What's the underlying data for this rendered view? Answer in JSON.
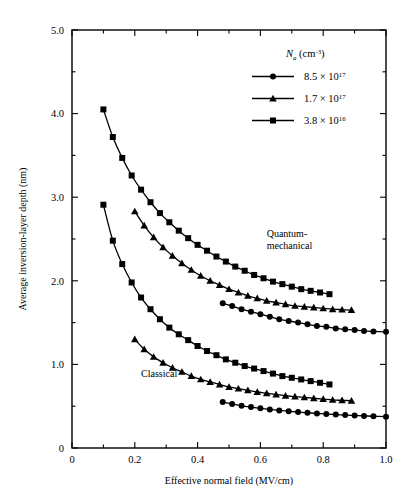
{
  "chart_data": {
    "type": "line",
    "title": "",
    "xlabel": "Effective normal field (MV/cm)",
    "ylabel": "Average inversion-layer depth (nm)",
    "xlim": [
      0,
      1.0
    ],
    "ylim": [
      0,
      5.0
    ],
    "xticks": [
      0,
      0.2,
      0.4,
      0.6,
      0.8,
      1.0
    ],
    "xticklabels": [
      "0",
      "0.2",
      "0.4",
      "0.6",
      "0.8",
      "1.0"
    ],
    "yticks": [
      0,
      1.0,
      2.0,
      3.0,
      4.0,
      5.0
    ],
    "yticklabels": [
      "0",
      "1.0",
      "2.0",
      "3.0",
      "4.0",
      "5.0"
    ],
    "xminor_step": 0.1,
    "yminor_step": 0.5,
    "grid": false,
    "legend_position": "top-right",
    "legend_title_parts": {
      "symbol": "N",
      "subscript": "a",
      "units": "(cm",
      "units_exp": "-3",
      "units_close": ")"
    },
    "annotations": [
      {
        "name": "quantum-mechanical-label",
        "text_line1": "Quantum-",
        "text_line2": "mechanical",
        "x": 0.62,
        "y": 2.52
      },
      {
        "name": "classical-label",
        "text": "Classical",
        "x": 0.22,
        "y": 0.85
      }
    ],
    "legend": [
      {
        "label_mantissa": "8.5 × 10",
        "label_exp": "17",
        "marker": "circle"
      },
      {
        "label_mantissa": "1.7 × 10",
        "label_exp": "17",
        "marker": "triangle"
      },
      {
        "label_mantissa": "3.8 × 10",
        "label_exp": "16",
        "marker": "square"
      }
    ],
    "series": [
      {
        "name": "quantum-mechanical-3.8e16",
        "group": "Quantum-mechanical",
        "marker": "square",
        "x": [
          0.1,
          0.13,
          0.16,
          0.19,
          0.22,
          0.25,
          0.28,
          0.31,
          0.34,
          0.37,
          0.4,
          0.43,
          0.46,
          0.49,
          0.52,
          0.55,
          0.58,
          0.61,
          0.64,
          0.67,
          0.7,
          0.73,
          0.76,
          0.79,
          0.82
        ],
        "y": [
          4.05,
          3.72,
          3.47,
          3.26,
          3.09,
          2.94,
          2.81,
          2.7,
          2.6,
          2.51,
          2.43,
          2.36,
          2.29,
          2.23,
          2.17,
          2.12,
          2.07,
          2.03,
          1.99,
          1.96,
          1.93,
          1.9,
          1.88,
          1.86,
          1.84
        ]
      },
      {
        "name": "quantum-mechanical-1.7e17",
        "group": "Quantum-mechanical",
        "marker": "triangle",
        "x": [
          0.2,
          0.23,
          0.26,
          0.29,
          0.32,
          0.35,
          0.38,
          0.41,
          0.44,
          0.47,
          0.5,
          0.53,
          0.56,
          0.59,
          0.62,
          0.65,
          0.68,
          0.71,
          0.74,
          0.77,
          0.8,
          0.83,
          0.86,
          0.89
        ],
        "y": [
          2.83,
          2.66,
          2.52,
          2.4,
          2.3,
          2.21,
          2.13,
          2.06,
          2.0,
          1.95,
          1.9,
          1.86,
          1.82,
          1.79,
          1.76,
          1.74,
          1.72,
          1.7,
          1.69,
          1.68,
          1.67,
          1.66,
          1.655,
          1.65
        ]
      },
      {
        "name": "quantum-mechanical-8.5e17",
        "group": "Quantum-mechanical",
        "marker": "circle",
        "x": [
          0.48,
          0.51,
          0.54,
          0.57,
          0.6,
          0.63,
          0.66,
          0.69,
          0.72,
          0.75,
          0.78,
          0.81,
          0.84,
          0.87,
          0.9,
          0.93,
          0.96,
          1.0
        ],
        "y": [
          1.73,
          1.7,
          1.66,
          1.63,
          1.6,
          1.57,
          1.54,
          1.52,
          1.5,
          1.48,
          1.46,
          1.45,
          1.43,
          1.42,
          1.41,
          1.4,
          1.395,
          1.39
        ]
      },
      {
        "name": "classical-3.8e16",
        "group": "Classical",
        "marker": "square",
        "x": [
          0.1,
          0.13,
          0.16,
          0.19,
          0.22,
          0.25,
          0.28,
          0.31,
          0.34,
          0.37,
          0.4,
          0.43,
          0.46,
          0.49,
          0.52,
          0.55,
          0.58,
          0.61,
          0.64,
          0.67,
          0.7,
          0.73,
          0.76,
          0.79,
          0.82
        ],
        "y": [
          2.91,
          2.48,
          2.2,
          1.98,
          1.8,
          1.66,
          1.54,
          1.44,
          1.36,
          1.29,
          1.22,
          1.16,
          1.11,
          1.06,
          1.02,
          0.98,
          0.95,
          0.92,
          0.89,
          0.86,
          0.84,
          0.82,
          0.8,
          0.78,
          0.76
        ]
      },
      {
        "name": "classical-1.7e17",
        "group": "Classical",
        "marker": "triangle",
        "x": [
          0.2,
          0.23,
          0.26,
          0.29,
          0.32,
          0.35,
          0.38,
          0.41,
          0.44,
          0.47,
          0.5,
          0.53,
          0.56,
          0.59,
          0.62,
          0.65,
          0.68,
          0.71,
          0.74,
          0.77,
          0.8,
          0.83,
          0.86,
          0.89
        ],
        "y": [
          1.3,
          1.18,
          1.09,
          1.02,
          0.96,
          0.91,
          0.86,
          0.82,
          0.79,
          0.76,
          0.73,
          0.71,
          0.69,
          0.67,
          0.655,
          0.64,
          0.625,
          0.615,
          0.605,
          0.595,
          0.585,
          0.575,
          0.57,
          0.565
        ]
      },
      {
        "name": "classical-8.5e17",
        "group": "Classical",
        "marker": "circle",
        "x": [
          0.48,
          0.51,
          0.54,
          0.57,
          0.6,
          0.63,
          0.66,
          0.69,
          0.72,
          0.75,
          0.78,
          0.81,
          0.84,
          0.87,
          0.9,
          0.93,
          0.96,
          1.0
        ],
        "y": [
          0.55,
          0.525,
          0.505,
          0.49,
          0.475,
          0.462,
          0.45,
          0.44,
          0.43,
          0.422,
          0.414,
          0.407,
          0.4,
          0.394,
          0.389,
          0.384,
          0.38,
          0.375
        ]
      }
    ]
  }
}
